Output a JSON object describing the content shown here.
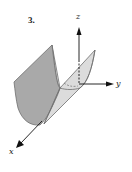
{
  "figure": {
    "number_label": "3.",
    "axes": {
      "x": {
        "label": "x"
      },
      "y": {
        "label": "y"
      },
      "z": {
        "label": "z"
      }
    },
    "colors": {
      "outer_surface": "#a9a9a9",
      "inner_surface": "#dcdcdc",
      "edge": "#6e6e6e",
      "axis": "#111111"
    }
  }
}
